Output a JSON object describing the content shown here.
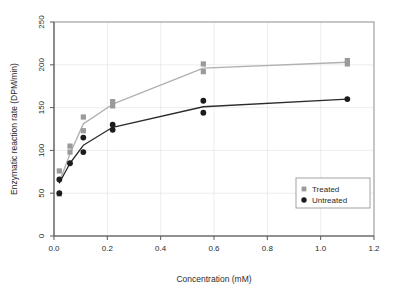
{
  "chart_data": {
    "type": "scatter",
    "title": "",
    "xlabel": "Concentration (mM)",
    "ylabel": "Enzymatic reaction rate (DPM/min)",
    "xlim": [
      0,
      1.2
    ],
    "ylim": [
      0,
      250
    ],
    "xticks": [
      "0.0",
      "0.2",
      "0.4",
      "0.6",
      "0.8",
      "1.0",
      "1.2"
    ],
    "xtick_values": [
      0.0,
      0.2,
      0.4,
      0.6,
      0.8,
      1.0,
      1.2
    ],
    "yticks": [
      "0",
      "50",
      "100",
      "150",
      "200",
      "250"
    ],
    "ytick_values": [
      0,
      50,
      100,
      150,
      200,
      250
    ],
    "grid": true,
    "grid_color": "#e8e8e8",
    "legend_position": "lower right",
    "series": [
      {
        "name": "Treated",
        "marker": "square",
        "color": "#9a9a9a",
        "line_color": "#b0b0b0",
        "points": [
          {
            "x": 0.02,
            "y": 76
          },
          {
            "x": 0.02,
            "y": 49
          },
          {
            "x": 0.06,
            "y": 105
          },
          {
            "x": 0.06,
            "y": 98
          },
          {
            "x": 0.11,
            "y": 139
          },
          {
            "x": 0.11,
            "y": 123
          },
          {
            "x": 0.22,
            "y": 157
          },
          {
            "x": 0.22,
            "y": 152
          },
          {
            "x": 0.56,
            "y": 201
          },
          {
            "x": 0.56,
            "y": 192
          },
          {
            "x": 1.1,
            "y": 205
          },
          {
            "x": 1.1,
            "y": 201
          }
        ],
        "line": [
          {
            "x": 0.02,
            "y": 63
          },
          {
            "x": 0.06,
            "y": 96
          },
          {
            "x": 0.11,
            "y": 131
          },
          {
            "x": 0.22,
            "y": 154
          },
          {
            "x": 0.56,
            "y": 196
          },
          {
            "x": 1.1,
            "y": 203
          }
        ]
      },
      {
        "name": "Untreated",
        "marker": "circle",
        "color": "#1c1c1c",
        "line_color": "#2b2b2b",
        "points": [
          {
            "x": 0.02,
            "y": 66
          },
          {
            "x": 0.02,
            "y": 50
          },
          {
            "x": 0.06,
            "y": 85
          },
          {
            "x": 0.11,
            "y": 115
          },
          {
            "x": 0.11,
            "y": 98
          },
          {
            "x": 0.22,
            "y": 130
          },
          {
            "x": 0.22,
            "y": 124
          },
          {
            "x": 0.56,
            "y": 158
          },
          {
            "x": 0.56,
            "y": 144
          },
          {
            "x": 1.1,
            "y": 160
          }
        ],
        "line": [
          {
            "x": 0.02,
            "y": 62
          },
          {
            "x": 0.06,
            "y": 85
          },
          {
            "x": 0.11,
            "y": 106
          },
          {
            "x": 0.22,
            "y": 127
          },
          {
            "x": 0.56,
            "y": 151
          },
          {
            "x": 1.1,
            "y": 160
          }
        ]
      }
    ]
  },
  "legend": {
    "items": [
      {
        "label": "Treated",
        "marker": "square",
        "color": "#9a9a9a"
      },
      {
        "label": "Untreated",
        "marker": "circle",
        "color": "#1c1c1c"
      }
    ]
  },
  "axes": {
    "x_title": "Concentration (mM)",
    "y_title": "Enzymatic reaction rate (DPM/min)"
  }
}
